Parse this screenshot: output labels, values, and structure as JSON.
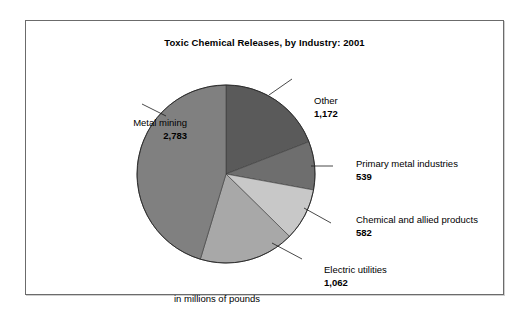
{
  "chart_data": {
    "type": "pie",
    "title": "Toxic Chemical Releases, by Industry: 2001",
    "caption": "in millions of pounds",
    "unit": "millions of pounds",
    "categories": [
      "Other",
      "Primary metal industries",
      "Chemical and allied products",
      "Electric utilities",
      "Metal mining"
    ],
    "values": [
      1172,
      539,
      582,
      1062,
      2783
    ],
    "value_labels": [
      "1,172",
      "539",
      "582",
      "1,062",
      "2,783"
    ],
    "colors": [
      "#5a5a5a",
      "#6e6e6e",
      "#c8c8c8",
      "#a8a8a8",
      "#808080"
    ],
    "total": 6138,
    "legend": "none",
    "labels_position": "callout",
    "slices": [
      {
        "name": "Other",
        "value": 1172,
        "value_label": "1,172",
        "color": "#5a5a5a",
        "percent": 19.1
      },
      {
        "name": "Primary metal industries",
        "value": 539,
        "value_label": "539",
        "color": "#6e6e6e",
        "percent": 8.8
      },
      {
        "name": "Chemical and allied products",
        "value": 582,
        "value_label": "582",
        "color": "#c8c8c8",
        "percent": 9.5
      },
      {
        "name": "Electric utilities",
        "value": 1062,
        "value_label": "1,062",
        "color": "#a8a8a8",
        "percent": 17.3
      },
      {
        "name": "Metal mining",
        "value": 2783,
        "value_label": "2,783",
        "color": "#808080",
        "percent": 45.3
      }
    ]
  },
  "figure": {
    "title": "Toxic Chemical Releases, by Industry: 2001",
    "caption": "in millions of pounds",
    "border_color": "#6b6b6b",
    "background": "#ffffff"
  },
  "labels": {
    "other": {
      "name": "Other",
      "value": "1,172"
    },
    "primary": {
      "name": "Primary metal industries",
      "value": "539"
    },
    "chemical": {
      "name": "Chemical and allied products",
      "value": "582"
    },
    "electric": {
      "name": "Electric utilities",
      "value": "1,062"
    },
    "mining": {
      "name": "Metal mining",
      "value": "2,783"
    }
  }
}
